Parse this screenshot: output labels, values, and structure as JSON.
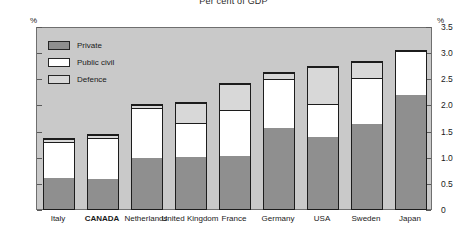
{
  "chart_data": {
    "type": "bar",
    "subtype": "stacked-bar",
    "title": "Per cent of GDP",
    "xlabel": "",
    "ylabel": "%",
    "ylabel_right": "%",
    "ylim": [
      0,
      3.5
    ],
    "yticks": [
      "0",
      "0.5",
      "1.0",
      "1.5",
      "2.0",
      "2.5",
      "3.0",
      "3.5"
    ],
    "ytick_values": [
      0,
      0.5,
      1.0,
      1.5,
      2.0,
      2.5,
      3.0,
      3.5
    ],
    "grid": false,
    "legend_position": "top-left",
    "categories": [
      "Italy",
      "CANADA",
      "Netherlands",
      "United Kingdom",
      "France",
      "Germany",
      "USA",
      "Sweden",
      "Japan"
    ],
    "highlighted_category": "CANADA",
    "series": [
      {
        "name": "Private",
        "color": "#8f8f8f",
        "values": [
          0.63,
          0.61,
          1.03,
          1.05,
          1.05,
          1.6,
          1.43,
          1.67,
          2.23
        ]
      },
      {
        "name": "Public civil",
        "color": "#ffffff",
        "values": [
          0.72,
          0.82,
          0.97,
          0.65,
          0.9,
          0.96,
          0.63,
          0.9,
          0.84
        ]
      },
      {
        "name": "Defence",
        "color": "#d8d8d8",
        "values": [
          0.04,
          0.04,
          0.04,
          0.39,
          0.5,
          0.09,
          0.71,
          0.3,
          0.0
        ]
      }
    ],
    "totals": [
      1.39,
      1.47,
      2.04,
      2.09,
      2.45,
      2.65,
      2.77,
      2.87,
      3.07
    ]
  },
  "legend": {
    "items": [
      {
        "label": "Private"
      },
      {
        "label": "Public civil"
      },
      {
        "label": "Defence"
      }
    ]
  }
}
